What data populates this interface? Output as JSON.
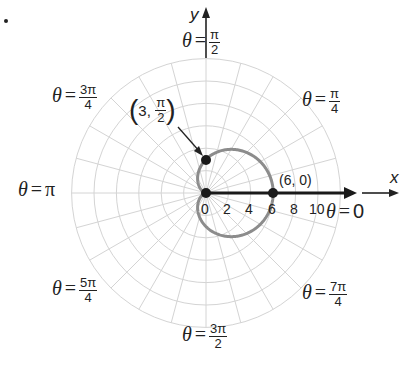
{
  "figure": {
    "bullet": "•",
    "axis_x_label": "x",
    "axis_y_label": "y",
    "theta_symbol": "θ",
    "equals": "=",
    "angle_labels": {
      "pi_over_2": {
        "num": "π",
        "den": "2"
      },
      "three_pi_over_4": {
        "num": "3π",
        "den": "4"
      },
      "pi_over_4": {
        "num": "π",
        "den": "4"
      },
      "pi": "π",
      "zero": "0",
      "five_pi_over_4": {
        "num": "5π",
        "den": "4"
      },
      "seven_pi_over_4": {
        "num": "7π",
        "den": "4"
      },
      "three_pi_over_2": {
        "num": "3π",
        "den": "2"
      }
    },
    "radial_ticks": [
      "0",
      "2",
      "4",
      "6",
      "8",
      "10"
    ],
    "point_a_label": {
      "prefix": "3,",
      "num": "π",
      "den": "2"
    },
    "point_b_label": "(6, 0)"
  },
  "chart_data": {
    "type": "line",
    "coordinate_system": "polar",
    "title": "",
    "curve": {
      "name": "cardioid",
      "equation": "r = 3 + 3cos(θ)",
      "color": "#8a8a8a",
      "samples": [
        {
          "theta": "0",
          "r": 6
        },
        {
          "theta": "π/4",
          "r": 5.12
        },
        {
          "theta": "π/2",
          "r": 3
        },
        {
          "theta": "3π/4",
          "r": 0.88
        },
        {
          "theta": "π",
          "r": 0
        },
        {
          "theta": "5π/4",
          "r": 0.88
        },
        {
          "theta": "3π/2",
          "r": 3
        },
        {
          "theta": "7π/4",
          "r": 5.12
        }
      ]
    },
    "highlighted_points": [
      {
        "label": "(3, π/2)",
        "r": 3,
        "theta": "π/2"
      },
      {
        "label": "(6, 0)",
        "r": 6,
        "theta": "0"
      },
      {
        "label": "pole",
        "r": 0,
        "theta": "0"
      }
    ],
    "polar_axis": {
      "from_r": 0,
      "to_r": 13,
      "theta": "0",
      "arrow": true
    },
    "radial_ticks": [
      0,
      2,
      4,
      6,
      8,
      10
    ],
    "radial_grid": [
      2,
      4,
      6,
      8,
      10,
      12
    ],
    "angular_grid_step_deg": 15,
    "angle_labels": [
      "θ = 0",
      "θ = π/4",
      "θ = π/2",
      "θ = 3π/4",
      "θ = π",
      "θ = 5π/4",
      "θ = 3π/2",
      "θ = 7π/4"
    ],
    "xlabel": "x",
    "ylabel": "y",
    "grid": true
  }
}
